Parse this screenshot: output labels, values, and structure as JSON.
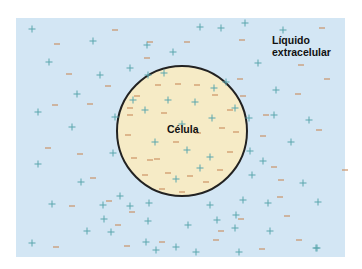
{
  "labels": {
    "extracellular_line1": "Líquido",
    "extracellular_line2": "extracelular",
    "cell": "Célula"
  },
  "colors": {
    "extracellular_fluid": "#d3e6f4",
    "cell_interior": "#f6ebc6",
    "membrane": "#222222",
    "positive_ion": "#5aa6ad",
    "negative_ion": "#c98a5c"
  },
  "cell": {
    "cx": 182,
    "cy": 131,
    "r": 65
  },
  "ions": {
    "outside_positive": [
      [
        32,
        29
      ],
      [
        93,
        41
      ],
      [
        147,
        45
      ],
      [
        173,
        52
      ],
      [
        49,
        62
      ],
      [
        100,
        75
      ],
      [
        130,
        68
      ],
      [
        77,
        94
      ],
      [
        38,
        112
      ],
      [
        72,
        127
      ],
      [
        115,
        117
      ],
      [
        133,
        100
      ],
      [
        148,
        75
      ],
      [
        164,
        73
      ],
      [
        200,
        27
      ],
      [
        221,
        28
      ],
      [
        245,
        23
      ],
      [
        283,
        30
      ],
      [
        258,
        63
      ],
      [
        226,
        82
      ],
      [
        235,
        108
      ],
      [
        276,
        90
      ],
      [
        249,
        118
      ],
      [
        274,
        115
      ],
      [
        291,
        142
      ],
      [
        309,
        120
      ],
      [
        250,
        151
      ],
      [
        263,
        161
      ],
      [
        252,
        175
      ],
      [
        303,
        183
      ],
      [
        243,
        200
      ],
      [
        268,
        203
      ],
      [
        236,
        215
      ],
      [
        217,
        220
      ],
      [
        235,
        228
      ],
      [
        270,
        231
      ],
      [
        317,
        248
      ],
      [
        239,
        252
      ],
      [
        196,
        252
      ],
      [
        176,
        247
      ],
      [
        156,
        250
      ],
      [
        148,
        221
      ],
      [
        111,
        232
      ],
      [
        104,
        219
      ],
      [
        120,
        196
      ],
      [
        130,
        206
      ],
      [
        149,
        203
      ],
      [
        103,
        205
      ],
      [
        81,
        182
      ],
      [
        52,
        204
      ],
      [
        38,
        164
      ],
      [
        87,
        231
      ],
      [
        32,
        243
      ],
      [
        113,
        153
      ],
      [
        146,
        242
      ],
      [
        318,
        202
      ],
      [
        316,
        248
      ],
      [
        210,
        205
      ],
      [
        188,
        225
      ]
    ],
    "outside_negative": [
      [
        57,
        44
      ],
      [
        115,
        30
      ],
      [
        150,
        42
      ],
      [
        147,
        58
      ],
      [
        69,
        74
      ],
      [
        108,
        86
      ],
      [
        55,
        105
      ],
      [
        90,
        104
      ],
      [
        130,
        108
      ],
      [
        187,
        42
      ],
      [
        242,
        40
      ],
      [
        322,
        28
      ],
      [
        240,
        79
      ],
      [
        243,
        96
      ],
      [
        266,
        115
      ],
      [
        298,
        94
      ],
      [
        263,
        136
      ],
      [
        319,
        130
      ],
      [
        274,
        167
      ],
      [
        281,
        180
      ],
      [
        280,
        197
      ],
      [
        241,
        219
      ],
      [
        287,
        216
      ],
      [
        299,
        240
      ],
      [
        262,
        249
      ],
      [
        216,
        240
      ],
      [
        162,
        242
      ],
      [
        127,
        246
      ],
      [
        56,
        247
      ],
      [
        48,
        148
      ],
      [
        80,
        154
      ],
      [
        93,
        178
      ],
      [
        72,
        206
      ],
      [
        132,
        212
      ],
      [
        118,
        225
      ],
      [
        109,
        201
      ],
      [
        221,
        231
      ],
      [
        301,
        65
      ],
      [
        327,
        79
      ],
      [
        345,
        170
      ]
    ],
    "inside_positive": [
      [
        168,
        100
      ],
      [
        195,
        102
      ],
      [
        182,
        124
      ],
      [
        155,
        142
      ],
      [
        187,
        150
      ],
      [
        210,
        157
      ],
      [
        176,
        179
      ],
      [
        212,
        118
      ],
      [
        145,
        110
      ],
      [
        214,
        88
      ],
      [
        200,
        168
      ]
    ],
    "inside_negative": [
      [
        137,
        96
      ],
      [
        158,
        85
      ],
      [
        178,
        84
      ],
      [
        197,
        85
      ],
      [
        215,
        95
      ],
      [
        230,
        110
      ],
      [
        236,
        132
      ],
      [
        230,
        152
      ],
      [
        220,
        170
      ],
      [
        206,
        182
      ],
      [
        182,
        192
      ],
      [
        162,
        189
      ],
      [
        145,
        175
      ],
      [
        134,
        158
      ],
      [
        128,
        135
      ],
      [
        130,
        115
      ],
      [
        164,
        113
      ],
      [
        150,
        160
      ],
      [
        157,
        159
      ],
      [
        198,
        133
      ],
      [
        176,
        142
      ],
      [
        190,
        176
      ],
      [
        168,
        173
      ],
      [
        222,
        128
      ]
    ]
  }
}
